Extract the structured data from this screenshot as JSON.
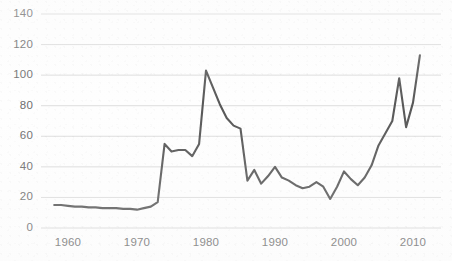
{
  "chart_data": {
    "type": "line",
    "title": "",
    "subtitle": "",
    "xlabel": "",
    "ylabel": "",
    "xlim": [
      1957,
      2012
    ],
    "ylim": [
      0,
      140
    ],
    "grid": true,
    "grid_axis": "y",
    "legend": false,
    "legend_position": "none",
    "line_color": "#585858",
    "grid_color": "#d9d9d9",
    "tick_color": "#6e6e6e",
    "background_color": "#ffffff",
    "y_ticks": [
      0,
      20,
      40,
      60,
      80,
      100,
      120,
      140
    ],
    "y_tick_labels": [
      "0",
      "20",
      "40",
      "60",
      "80",
      "100",
      "120",
      "140"
    ],
    "x_ticks": [
      1960,
      1970,
      1980,
      1990,
      2000,
      2010
    ],
    "x_tick_labels": [
      "1960",
      "1970",
      "1980",
      "1990",
      "2000",
      "2010"
    ],
    "series": [
      {
        "name": "price",
        "x": [
          1958,
          1959,
          1960,
          1961,
          1962,
          1963,
          1964,
          1965,
          1966,
          1967,
          1968,
          1969,
          1970,
          1971,
          1972,
          1973,
          1974,
          1975,
          1976,
          1977,
          1978,
          1979,
          1980,
          1981,
          1982,
          1983,
          1984,
          1985,
          1986,
          1987,
          1988,
          1989,
          1990,
          1991,
          1992,
          1993,
          1994,
          1995,
          1996,
          1997,
          1998,
          1999,
          2000,
          2001,
          2002,
          2003,
          2004,
          2005,
          2006,
          2007,
          2008,
          2009,
          2010,
          2011
        ],
        "values": [
          15,
          15,
          14.5,
          14,
          14,
          13.5,
          13.5,
          13,
          13,
          13,
          12.5,
          12.5,
          12,
          13,
          14,
          17,
          55,
          50,
          51,
          51,
          47,
          55,
          103,
          92,
          81,
          72,
          67,
          65,
          31,
          38,
          29,
          34,
          40,
          33,
          31,
          28,
          26,
          27,
          30,
          27,
          19,
          27,
          37,
          32,
          28,
          33,
          41,
          54,
          62,
          70,
          98,
          66,
          82,
          113
        ]
      }
    ],
    "annotations": []
  }
}
